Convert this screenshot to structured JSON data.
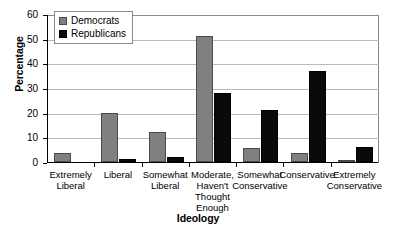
{
  "chart_data": {
    "type": "bar",
    "title": "",
    "xlabel": "Ideology",
    "ylabel": "Percentage",
    "ylim": [
      0,
      60
    ],
    "ytick_step": 10,
    "yticks": [
      0,
      10,
      20,
      30,
      40,
      50,
      60
    ],
    "grid": true,
    "legend_position": "top-left",
    "categories": [
      "Extremely Liberal",
      "Liberal",
      "Somewhat Liberal",
      "Moderate, Haven't Thought Enough",
      "Somewhat Conservative",
      "Conservative",
      "Extremely Conservative"
    ],
    "category_lines": [
      [
        "Extremely",
        "Liberal"
      ],
      [
        "Liberal"
      ],
      [
        "Somewhat",
        "Liberal"
      ],
      [
        "Moderate,",
        "Haven't",
        "Thought",
        "Enough"
      ],
      [
        "Somewhat",
        "Conservative"
      ],
      [
        "Conservative"
      ],
      [
        "Extremely",
        "Conservative"
      ]
    ],
    "series": [
      {
        "name": "Democrats",
        "color": "#808080",
        "values": [
          3.5,
          20.0,
          12.2,
          51.0,
          5.5,
          3.5,
          0.3
        ]
      },
      {
        "name": "Republicans",
        "color": "#0a0a0a",
        "values": [
          0.0,
          1.2,
          2.0,
          28.0,
          21.0,
          37.0,
          6.0
        ]
      }
    ]
  },
  "legend": {
    "items": [
      {
        "label": "Democrats",
        "swatch": "democrats-swatch"
      },
      {
        "label": "Republicans",
        "swatch": "republicans-swatch"
      }
    ]
  }
}
